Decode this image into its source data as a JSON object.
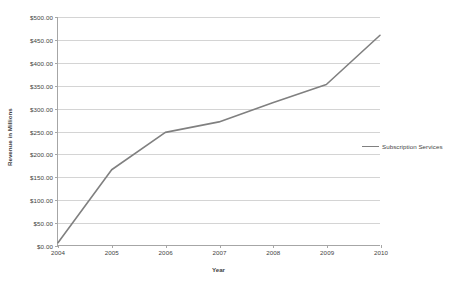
{
  "chart_data": {
    "type": "line",
    "title": "",
    "xlabel": "Year",
    "ylabel": "Revenue in Millions",
    "categories": [
      "2004",
      "2005",
      "2006",
      "2007",
      "2008",
      "2009",
      "2010"
    ],
    "series": [
      {
        "name": "Subscription Services",
        "color": "#808080",
        "values": [
          5,
          165,
          247,
          270,
          312,
          352,
          460
        ]
      }
    ],
    "ylim": [
      0,
      500
    ],
    "ytick_step": 50,
    "ytick_labels": [
      "$0.00",
      "$50.00",
      "$100.00",
      "$150.00",
      "$200.00",
      "$250.00",
      "$300.00",
      "$350.00",
      "$400.00",
      "$450.00",
      "$500.00"
    ],
    "ytick_values": [
      0,
      50,
      100,
      150,
      200,
      250,
      300,
      350,
      400,
      450,
      500
    ],
    "grid": true,
    "grid_axis": "y",
    "legend_position": "right",
    "legend_entries": [
      "Subscription Services"
    ],
    "colors": {
      "series_line": "#808080",
      "gridline": "#d4d4d4",
      "axis": "#a6a6a6",
      "text": "#3f3f3f",
      "background": "#ffffff"
    }
  }
}
